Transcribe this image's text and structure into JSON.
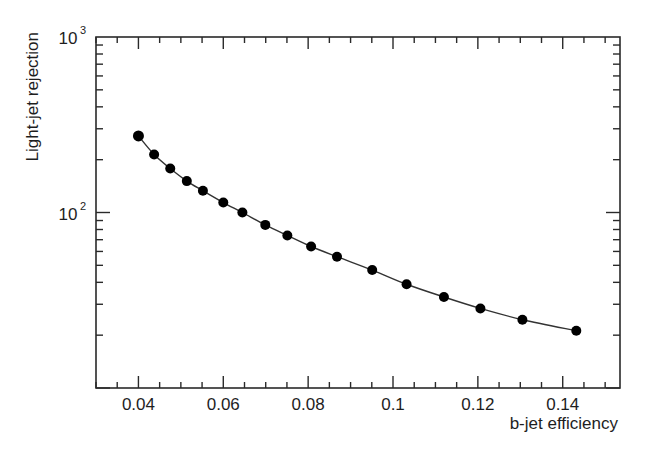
{
  "chart_data": {
    "type": "line",
    "title": "",
    "xlabel": "b-jet efficiency",
    "ylabel": "Light-jet rejection",
    "xlim": [
      0.03,
      0.1535
    ],
    "ylim": [
      10,
      1000
    ],
    "yscale": "log",
    "xscale": "linear",
    "grid": false,
    "legend": null,
    "x_ticks": [
      0.04,
      0.06,
      0.08,
      0.1,
      0.12,
      0.14
    ],
    "x_tick_labels": [
      "0.04",
      "0.06",
      "0.08",
      "0.1",
      "0.12",
      "0.14"
    ],
    "x_minor_step": 0.005,
    "y_ticks": [
      100,
      1000
    ],
    "y_tick_labels": [
      {
        "base": "10",
        "exp": "2"
      },
      {
        "base": "10",
        "exp": "3"
      }
    ],
    "series": [
      {
        "name": "Light-jet rejection vs b-jet efficiency",
        "marker": "filled-circle",
        "line": "smooth",
        "color": "#000000",
        "x": [
          0.04,
          0.0437,
          0.0475,
          0.0514,
          0.0552,
          0.06,
          0.0645,
          0.0699,
          0.0751,
          0.0807,
          0.0868,
          0.0951,
          0.1032,
          0.112,
          0.1206,
          0.1305,
          0.1432
        ],
        "y": [
          273,
          214,
          178,
          151,
          133,
          114,
          100,
          85,
          74,
          64,
          56,
          47,
          39,
          33,
          28.4,
          24.5,
          21.2
        ]
      }
    ]
  },
  "labels": {
    "xlabel": "b-jet efficiency",
    "ylabel": "Light-jet rejection"
  }
}
